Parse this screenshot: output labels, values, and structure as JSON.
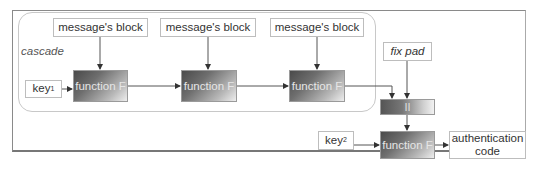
{
  "diagram": {
    "cascade_label": "cascade",
    "message_blocks": [
      {
        "label": "message's block"
      },
      {
        "label": "message's block"
      },
      {
        "label": "message's block"
      }
    ],
    "key1": {
      "base": "key",
      "sub": "1"
    },
    "cascade_functions": [
      {
        "label": "function F"
      },
      {
        "label": "function F"
      },
      {
        "label": "function F"
      }
    ],
    "fix_pad": {
      "label": "fix pad"
    },
    "concat": {
      "label": "II"
    },
    "key2": {
      "base": "key",
      "sub": "2"
    },
    "final_function": {
      "label": "function F"
    },
    "output": {
      "line1": "authentication",
      "line2": "code"
    },
    "colors": {
      "line": "#555555",
      "box_border": "#bdbdbd",
      "frame": "#8a8a8a"
    }
  }
}
